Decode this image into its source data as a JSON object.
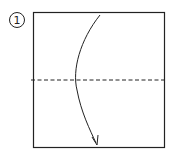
{
  "diagram": {
    "type": "origami-instruction",
    "step": {
      "number": "1"
    },
    "paper": {
      "shape": "square",
      "x": 33,
      "y": 12,
      "width": 132,
      "height": 136,
      "stroke_color": "#222222"
    },
    "fold_line": {
      "style": "valley-dashed",
      "y": 80,
      "x1": 31,
      "x2": 167
    },
    "arrow": {
      "direction": "top-to-bottom",
      "meaning": "fold top half down"
    }
  }
}
